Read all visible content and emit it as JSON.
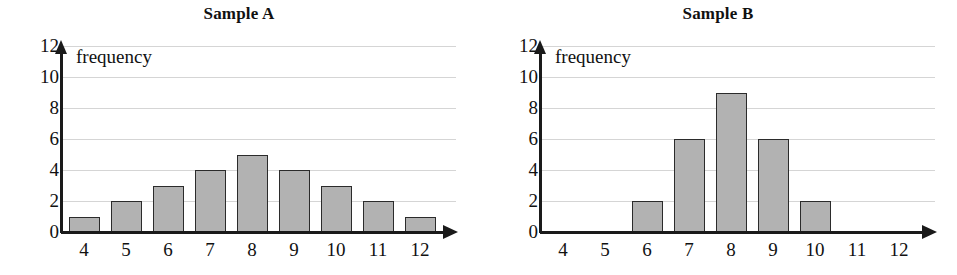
{
  "figure": {
    "background": "#ffffff",
    "bar_fill": "#b2b2b2",
    "bar_stroke": "#2b2b2b",
    "grid_color": "#d5d5d5",
    "axis_color": "#1a1a1a"
  },
  "chart_data": [
    {
      "type": "bar",
      "title": "Sample A",
      "xlabel": "",
      "ylabel": "frequency",
      "categories": [
        "4",
        "5",
        "6",
        "7",
        "8",
        "9",
        "10",
        "11",
        "12"
      ],
      "values": [
        1,
        2,
        3,
        4,
        5,
        4,
        3,
        2,
        1
      ],
      "ylim": [
        0,
        12
      ],
      "yticks": [
        "0",
        "2",
        "4",
        "6",
        "8",
        "10",
        "12"
      ],
      "ytick_values": [
        0,
        2,
        4,
        6,
        8,
        10,
        12
      ],
      "grid": "horizontal",
      "legend": "none"
    },
    {
      "type": "bar",
      "title": "Sample B",
      "xlabel": "",
      "ylabel": "frequency",
      "categories": [
        "4",
        "5",
        "6",
        "7",
        "8",
        "9",
        "10",
        "11",
        "12"
      ],
      "values": [
        0,
        0,
        2,
        6,
        9,
        6,
        2,
        0,
        0
      ],
      "ylim": [
        0,
        12
      ],
      "yticks": [
        "0",
        "2",
        "4",
        "6",
        "8",
        "10",
        "12"
      ],
      "ytick_values": [
        0,
        2,
        4,
        6,
        8,
        10,
        12
      ],
      "grid": "horizontal",
      "legend": "none"
    }
  ]
}
